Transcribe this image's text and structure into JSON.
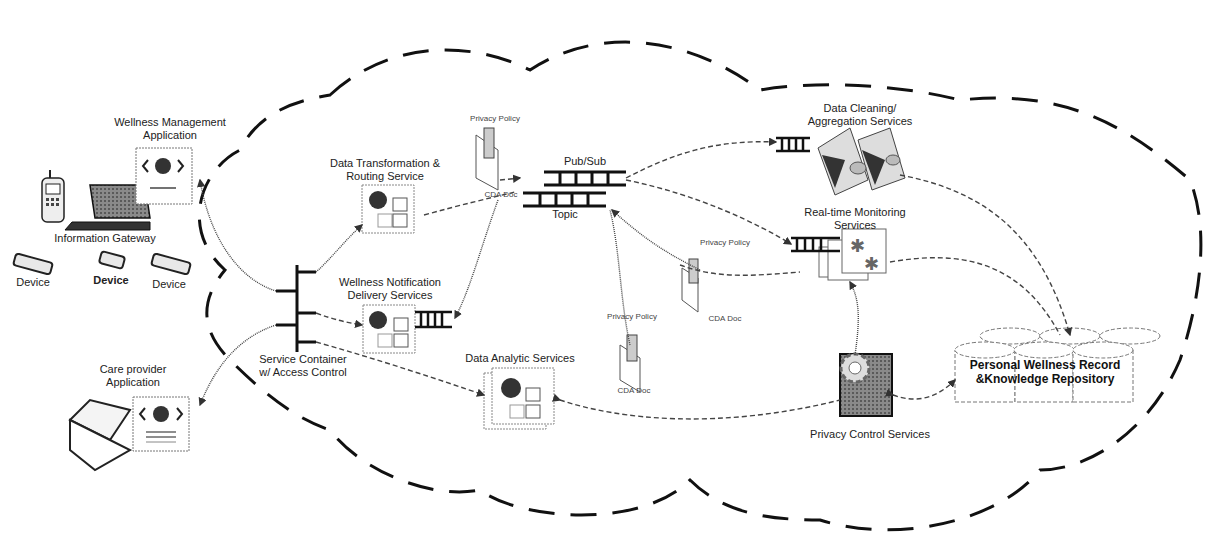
{
  "diagram": {
    "type": "architecture",
    "cloud_style": "dashed",
    "colors": {
      "ink": "#111111",
      "connector": "#444444",
      "background": "#ffffff",
      "gray_fill": "#7a7a7a"
    }
  },
  "client_side": {
    "wellness_app": {
      "label_line1": "Wellness Management",
      "label_line2": "Application",
      "icon": "web-app-icon"
    },
    "gateway": {
      "label": "Information Gateway",
      "icons": [
        "mobile-phone-icon",
        "laptop-icon"
      ]
    },
    "devices": [
      {
        "label": "Device",
        "icon": "device-icon"
      },
      {
        "label": "Device",
        "icon": "device-icon"
      },
      {
        "label": "Device",
        "icon": "device-icon"
      }
    ],
    "care_provider_app": {
      "label_line1": "Care provider",
      "label_line2": "Application",
      "icons": [
        "laptop-icon",
        "web-app-icon"
      ]
    }
  },
  "cloud_services": {
    "service_container": {
      "label_line1": "Service Container",
      "label_line2": "w/ Access Control"
    },
    "data_transformation": {
      "label_line1": "Data Transformation &",
      "label_line2": "Routing Service"
    },
    "wellness_notification": {
      "label_line1": "Wellness Notification",
      "label_line2": "Delivery Services"
    },
    "data_analytic": {
      "label": "Data Analytic Services"
    },
    "pubsub": {
      "label_top": "Pub/Sub",
      "label_bottom": "Topic"
    },
    "data_cleaning": {
      "label_line1": "Data Cleaning/",
      "label_line2": "Aggregation Services"
    },
    "realtime_monitoring": {
      "label_line1": "Real-time Monitoring",
      "label_line2": "Services"
    },
    "privacy_control": {
      "label": "Privacy Control Services"
    },
    "repository": {
      "label_line1": "Personal Wellness Record",
      "label_line2": "&Knowledge Repository"
    },
    "documents": [
      {
        "policy_label": "Privacy Policy",
        "doc_label": "CDA Doc"
      },
      {
        "policy_label": "Privacy Policy",
        "doc_label": "CDA Doc"
      },
      {
        "policy_label": "Privacy Policy",
        "doc_label": "CDA Doc"
      }
    ]
  }
}
